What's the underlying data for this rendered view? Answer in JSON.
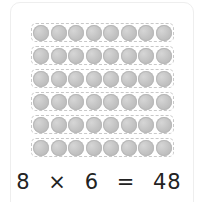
{
  "array": {
    "rows": 6,
    "columns": 8,
    "counter_color": "#c4c4c4",
    "row_border_color": "#c8c8c8"
  },
  "equation": {
    "factor_a": "8",
    "operator": "×",
    "factor_b": "6",
    "equals": "=",
    "product": "48"
  }
}
